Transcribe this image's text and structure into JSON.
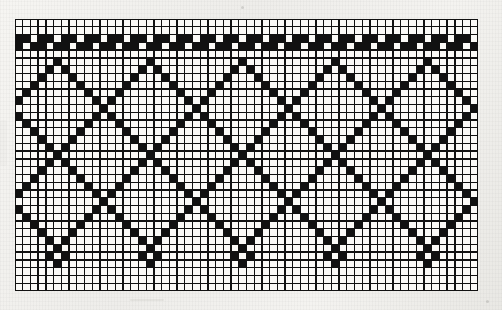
{
  "document": {
    "kind": "filet-crochet-chart",
    "title": "",
    "caption": "",
    "background_color": "#f1f0ed",
    "ink_color": "#111111",
    "cell_color": "#fbfaf7",
    "grid_line_color": "#111111"
  },
  "chart_data": {
    "type": "heatmap",
    "title": "",
    "subtitle": "",
    "xlabel": "",
    "ylabel": "",
    "grid": true,
    "legend_position": "none",
    "columns": 60,
    "rows": 35,
    "cell_size_px": 7.7,
    "origin_px": {
      "x": 15,
      "y": 19
    },
    "size_px": {
      "width": 463,
      "height": 272
    },
    "value_legend": [
      {
        "value": 0,
        "name": "open-mesh-cell",
        "color": "#fbfaf7"
      },
      {
        "value": 1,
        "name": "filled-block-cell",
        "color": "#111111"
      }
    ],
    "motifs": [
      "checkered-top-border-band",
      "argyle-diamond-lattice",
      "diagonal-crossing-lines",
      "dotted-diamond-bottom-row",
      "open-mesh-field"
    ],
    "horizontal_repeat_columns": 12,
    "motif_repeat_count": 5,
    "matrix": [
      "000000000000000000000000000000000000000000000000000000000000",
      "000000000000000000000000000000000000000000000000000000000000",
      "110110110110110110110110110110110110110110110110110110110110",
      "101101101101101101101101101101101101101101101101101101101101",
      "000000000000000000000000000000000000000000000000000000000000",
      "000001000000000001000000000001000000000001000000000001000000",
      "000010100000000010100000000010100000000010100000000010100000",
      "000100010000000100010000000100010000000100010000000100010000",
      "001000001000001000001000001000001000001000001000001000001000",
      "010000000100010000000100010000000100010000000100010000000100",
      "100000000010100000000010100000000010100000000010100000000010",
      "000000000001000000000001000000000001000000000001000000000001",
      "100000000010100000000010100000000010100000000010100000000010",
      "010000000100010000000100010000000100010000000100010000000100",
      "001000001000001000001000001000001000001000001000001000001000",
      "000100010000000100010000000100010000000100010000000100010000",
      "000010100000000010100000000010100000000010100000000010100000",
      "000001000000000001000000000001000000000001000000000001000000",
      "000010100000000010100000000010100000000010100000000010100000",
      "000100010000000100010000000100010000000100010000000100010000",
      "001000001000001000001000001000001000001000001000001000001000",
      "010000000100010000000100010000000100010000000100010000000100",
      "100000000010100000000010100000000010100000000010100000000010",
      "000000000001000000000001000000000001000000000001000000000001",
      "100000000010100000000010100000000010100000000010100000000010",
      "010000000100010000000100010000000100010000000100010000000100",
      "001000001000001000001000001000001000001000001000001000001000",
      "000100010000000100010000000100010000000100010000000100010000",
      "000010100000000010100000000010100000000010100000000010100000",
      "000001000000000001000000000001000000000001000000000001000000",
      "000010100000000010100000000010100000000010100000000010100000",
      "000001000000000001000000000001000000000001000000000001000000",
      "000000000000000000000000000000000000000000000000000000000000",
      "000000000000000000000000000000000000000000000000000000000000",
      "000000000000000000000000000000000000000000000000000000000000"
    ]
  }
}
